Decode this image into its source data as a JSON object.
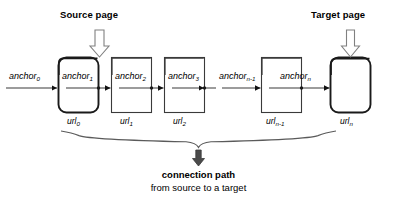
{
  "diagram": {
    "title_source": "Source page",
    "title_target": "Target page",
    "caption_bold": "connection path",
    "caption_regular": "from source to a target",
    "colors": {
      "stroke": "#3a3a3a",
      "stroke_emphasis": "#1a1a1a",
      "text": "#000000",
      "background": "#ffffff"
    },
    "nodes": [
      {
        "id": "n0",
        "url_label": "url",
        "url_sub": "0",
        "anchor_label": "anchor",
        "anchor_sub": "1",
        "shape": "rounded",
        "emphasis": true
      },
      {
        "id": "n1",
        "url_label": "url",
        "url_sub": "1",
        "anchor_label": "anchor",
        "anchor_sub": "2",
        "shape": "square",
        "emphasis": false
      },
      {
        "id": "n2",
        "url_label": "url",
        "url_sub": "2",
        "anchor_label": "anchor",
        "anchor_sub": "3",
        "shape": "square",
        "emphasis": false
      },
      {
        "id": "n3",
        "url_label": "url",
        "url_sub": "n-1",
        "anchor_label": "anchor",
        "anchor_sub": "n",
        "shape": "square",
        "emphasis": false
      },
      {
        "id": "n4",
        "url_label": "url",
        "url_sub": "n",
        "anchor_label": "",
        "anchor_sub": "",
        "shape": "rounded",
        "emphasis": true
      }
    ],
    "incoming_anchors": [
      {
        "label": "anchor",
        "sub": "0",
        "for_node": "n0"
      },
      {
        "label": "anchor",
        "sub": "n-1",
        "for_node": "n3"
      }
    ],
    "arrows": {
      "source_pointer": "down-block-arrow",
      "target_pointer": "down-block-arrow",
      "result_pointer": "down-solid-arrow"
    },
    "brace": {
      "style": "curly-down",
      "spans": "all-nodes"
    },
    "ellipsis_gap": true
  }
}
